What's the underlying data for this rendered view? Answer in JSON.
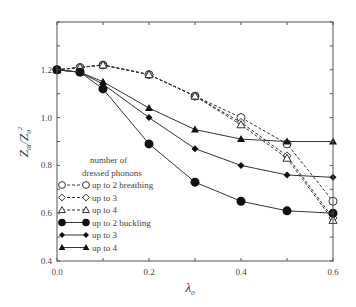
{
  "chart_data": {
    "type": "line",
    "title": "",
    "xlabel": "λ0",
    "ylabel": "Z0l/Z0^2",
    "xlim": [
      0.0,
      0.6
    ],
    "ylim": [
      0.4,
      1.4
    ],
    "xticks": [
      "0.0",
      "0.2",
      "0.4",
      "0.6"
    ],
    "yticks": [
      "0.4",
      "0.6",
      "0.8",
      "1.0",
      "1.2"
    ],
    "grid": false,
    "legend": {
      "title_line1": "number of",
      "title_line2": "dressed phonons",
      "position": "lower-left"
    },
    "x": [
      0.0,
      0.05,
      0.1,
      0.2,
      0.3,
      0.4,
      0.5,
      0.6
    ],
    "series": [
      {
        "name": "up to 2 breathing",
        "marker": "open-circle",
        "dash": true,
        "values": [
          1.2,
          1.21,
          1.22,
          1.18,
          1.09,
          1.0,
          0.89,
          0.65
        ]
      },
      {
        "name": "up to 3",
        "marker": "open-diamond",
        "dash": true,
        "values": [
          1.2,
          1.21,
          1.22,
          1.18,
          1.09,
          0.98,
          0.84,
          0.58
        ]
      },
      {
        "name": "up to 4",
        "marker": "open-triangle",
        "dash": true,
        "values": [
          1.2,
          1.21,
          1.22,
          1.18,
          1.09,
          0.97,
          0.83,
          0.57
        ]
      },
      {
        "name": "up to 2 buckling",
        "marker": "filled-circle",
        "dash": false,
        "values": [
          1.2,
          1.19,
          1.12,
          0.89,
          0.73,
          0.65,
          0.61,
          0.6
        ]
      },
      {
        "name": "up to 3",
        "marker": "filled-diamond",
        "dash": false,
        "values": [
          1.2,
          1.19,
          1.14,
          1.0,
          0.87,
          0.8,
          0.76,
          0.75
        ]
      },
      {
        "name": "up to 4",
        "marker": "filled-triangle",
        "dash": false,
        "values": [
          1.2,
          1.19,
          1.15,
          1.04,
          0.95,
          0.91,
          0.9,
          0.9
        ]
      }
    ]
  },
  "axes": {
    "xlabel_main": "λ",
    "xlabel_sub": "0",
    "ylabel_num": "Z",
    "ylabel_num_sub": "0l",
    "ylabel_den": "Z",
    "ylabel_den_sub": "0",
    "ylabel_den_sup": "2"
  },
  "colors": {
    "line": "#333333",
    "frame": "#555555",
    "text": "#444444"
  }
}
